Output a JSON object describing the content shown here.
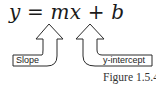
{
  "figure": {
    "equation": {
      "y": "y",
      "eq": "=",
      "mx": "mx",
      "plus": "+",
      "b": "b"
    },
    "annotations": [
      {
        "label": "Slope",
        "points_to": "m"
      },
      {
        "label": "y-intercept",
        "points_to": "b"
      }
    ],
    "caption": "Figure 1.5.4"
  },
  "colors": {
    "stroke": "#2a2a2a",
    "text": "#1a1a1a",
    "background": "#ffffff"
  }
}
